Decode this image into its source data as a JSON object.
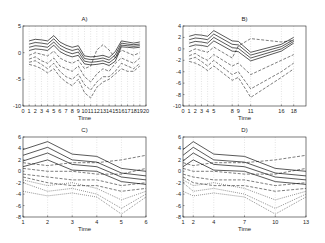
{
  "chart_data": [
    {
      "type": "line",
      "title": "A)",
      "xlabel": "Time",
      "ylabel": "",
      "x": [
        1,
        2,
        3,
        4,
        5,
        6,
        7,
        8,
        9,
        10,
        11,
        12,
        13,
        14,
        15,
        16,
        17,
        18,
        19,
        20
      ],
      "xticks": [
        "0",
        "1",
        "2",
        "3",
        "4",
        "5",
        "6",
        "7",
        "8",
        "9",
        "10",
        "11",
        "12",
        "13",
        "14",
        "15",
        "16",
        "17",
        "18",
        "19",
        "20"
      ],
      "xlim": [
        0,
        20
      ],
      "ylim": [
        -10,
        5
      ],
      "yticks": [
        "5",
        "0",
        "-5",
        "-10"
      ],
      "grid": "vertical dotted",
      "series": [
        {
          "name": "solid-1",
          "style": "solid",
          "values": [
            2.2,
            2.5,
            2.4,
            2.2,
            3.2,
            2.0,
            1.4,
            1.0,
            1.3,
            -0.6,
            -0.8,
            -0.7,
            -0.5,
            -0.9,
            0.2,
            2.2,
            2.0,
            1.8,
            2.0
          ]
        },
        {
          "name": "solid-2",
          "style": "solid",
          "values": [
            1.6,
            1.9,
            1.8,
            1.6,
            2.6,
            1.4,
            0.8,
            0.4,
            0.7,
            -1.1,
            -1.3,
            -1.2,
            -1.0,
            -1.4,
            -0.4,
            1.8,
            1.6,
            1.5,
            1.6
          ]
        },
        {
          "name": "solid-3",
          "style": "solid",
          "values": [
            1.0,
            1.3,
            1.2,
            1.0,
            2.0,
            0.8,
            0.2,
            -0.2,
            0.1,
            -1.6,
            -1.8,
            -1.7,
            -1.5,
            -1.9,
            -1.0,
            1.4,
            1.3,
            1.2,
            1.3
          ]
        },
        {
          "name": "solid-4",
          "style": "solid",
          "values": [
            0.4,
            0.7,
            0.6,
            0.4,
            1.4,
            0.2,
            -0.4,
            -0.8,
            -0.5,
            -2.1,
            -2.3,
            -2.2,
            -2.0,
            -2.4,
            -1.6,
            1.1,
            1.0,
            0.9,
            1.0
          ]
        },
        {
          "name": "dash-1",
          "style": "dashed",
          "values": [
            -0.5,
            0,
            -0.3,
            -0.6,
            0.3,
            -1.0,
            -1.6,
            -2.0,
            -1.4,
            -3.0,
            -2.5,
            0.5,
            1.5,
            0.5,
            -1.0,
            0.5,
            0,
            -0.5,
            0
          ]
        },
        {
          "name": "dash-2",
          "style": "dashed",
          "values": [
            -1.2,
            -0.8,
            -1.5,
            -2.0,
            -1.0,
            -2.5,
            -3.0,
            -3.5,
            -2.5,
            -4.5,
            -5.5,
            -4.0,
            -3.0,
            -3.5,
            -2.0,
            -1.0,
            -1.5,
            -2.0,
            -1.0
          ]
        },
        {
          "name": "dash-3",
          "style": "dashed",
          "values": [
            -1.8,
            -1.5,
            -2.2,
            -3.0,
            -2.0,
            -3.5,
            -4.5,
            -5.0,
            -4.0,
            -6.0,
            -7.0,
            -5.5,
            -4.5,
            -4.5,
            -3.5,
            -2.0,
            -2.5,
            -3.0,
            -2.0
          ]
        },
        {
          "name": "dash-4",
          "style": "dashed",
          "values": [
            -2.2,
            -2.5,
            -3.0,
            -3.8,
            -3.0,
            -4.5,
            -5.5,
            -6.2,
            -5.0,
            -7.5,
            -8.5,
            -6.5,
            -5.5,
            -5.0,
            -4.0,
            -3.0,
            -3.5,
            -3.5,
            -2.5
          ]
        }
      ]
    },
    {
      "type": "line",
      "title": "B)",
      "xlabel": "Time",
      "ylabel": "",
      "x": [
        1,
        2,
        3,
        4,
        5,
        8,
        9,
        11,
        16,
        18
      ],
      "xticks": [
        "0",
        "1",
        "2",
        "3",
        "4",
        "5",
        "8",
        "9",
        "11",
        "16",
        "18"
      ],
      "xlim": [
        0,
        20
      ],
      "ylim": [
        -10,
        4
      ],
      "yticks": [
        "4",
        "2",
        "0",
        "-2",
        "-4",
        "-6",
        "-8",
        "-10"
      ],
      "grid": "vertical dotted",
      "series": [
        {
          "name": "solid-1",
          "style": "solid",
          "values": [
            2.2,
            2.5,
            2.4,
            2.2,
            3.2,
            1.4,
            1.3,
            -0.6,
            0.8,
            2.0
          ]
        },
        {
          "name": "solid-2",
          "style": "solid",
          "values": [
            1.6,
            1.9,
            1.8,
            1.6,
            2.6,
            0.8,
            0.7,
            -1.1,
            0.4,
            1.6
          ]
        },
        {
          "name": "solid-3",
          "style": "solid",
          "values": [
            1.0,
            1.3,
            1.2,
            1.0,
            2.0,
            0.2,
            0.1,
            -1.6,
            0,
            1.3
          ]
        },
        {
          "name": "solid-4",
          "style": "solid",
          "values": [
            0.4,
            0.7,
            0.6,
            0.4,
            1.4,
            -0.4,
            -0.5,
            -2.1,
            -0.4,
            1.0
          ]
        },
        {
          "name": "dash-1",
          "style": "dashed",
          "values": [
            -0.5,
            0,
            -0.3,
            -0.6,
            0.3,
            -1.6,
            0.5,
            1.8,
            1.2,
            1.5
          ]
        },
        {
          "name": "dash-2",
          "style": "dashed",
          "values": [
            -1.2,
            -0.8,
            -1.5,
            -2.0,
            -1.0,
            -3.0,
            -2.5,
            -4.5,
            -2.0,
            -1.0
          ]
        },
        {
          "name": "dash-3",
          "style": "dashed",
          "values": [
            -1.8,
            -1.5,
            -2.2,
            -3.0,
            -2.0,
            -4.5,
            -4.0,
            -7.0,
            -4.0,
            -2.5
          ]
        },
        {
          "name": "dash-4",
          "style": "dashed",
          "values": [
            -2.2,
            -2.5,
            -3.0,
            -3.8,
            -3.0,
            -5.5,
            -5.0,
            -8.5,
            -5.0,
            -3.5
          ]
        }
      ]
    },
    {
      "type": "line",
      "title": "C)",
      "xlabel": "Time",
      "ylabel": "",
      "x": [
        1,
        2,
        3,
        4,
        5,
        6
      ],
      "xticks": [
        "1",
        "2",
        "3",
        "4",
        "5",
        "6"
      ],
      "xlim": [
        1,
        6
      ],
      "ylim": [
        -8,
        6
      ],
      "yticks": [
        "6",
        "4",
        "2",
        "0",
        "-2",
        "-4",
        "-6",
        "-8"
      ],
      "grid": "vertical dotted",
      "series": [
        {
          "name": "solid-1",
          "style": "solid",
          "values": [
            3.8,
            5.2,
            3.0,
            2.6,
            0.5,
            0
          ]
        },
        {
          "name": "solid-2",
          "style": "solid",
          "values": [
            2.8,
            4.2,
            2.0,
            1.6,
            -0.3,
            -0.8
          ]
        },
        {
          "name": "solid-3",
          "style": "solid",
          "values": [
            1.8,
            3.2,
            1.2,
            0.8,
            -1.0,
            -1.5
          ]
        },
        {
          "name": "solid-4",
          "style": "solid",
          "values": [
            0.8,
            2.0,
            0.2,
            0,
            -1.8,
            -2.3
          ]
        },
        {
          "name": "dash-1",
          "style": "dashed",
          "values": [
            1.5,
            1.0,
            1.5,
            1.5,
            2.0,
            2.8
          ]
        },
        {
          "name": "dash-2",
          "style": "dashed",
          "values": [
            0.5,
            0,
            0,
            -0.5,
            -0.5,
            0.5
          ]
        },
        {
          "name": "dash-3",
          "style": "dashed",
          "values": [
            -0.5,
            -1.0,
            -1.5,
            -1.5,
            -2.5,
            -2.0
          ]
        },
        {
          "name": "dash-4",
          "style": "dashed",
          "values": [
            -1.0,
            -2.0,
            -2.5,
            -2.5,
            -3.5,
            -3.0
          ]
        },
        {
          "name": "dot-1",
          "style": "dotted",
          "values": [
            -1.5,
            -2.5,
            -2.0,
            -3.0,
            -5.0,
            -3.5
          ]
        },
        {
          "name": "dot-2",
          "style": "dotted",
          "values": [
            -2.0,
            -3.5,
            -3.0,
            -4.0,
            -6.5,
            -4.0
          ]
        },
        {
          "name": "dot-3",
          "style": "dotted",
          "values": [
            -3.5,
            -4.3,
            -3.8,
            -4.5,
            -7.5,
            -4.5
          ]
        }
      ]
    },
    {
      "type": "line",
      "title": "D)",
      "xlabel": "Time",
      "ylabel": "",
      "x": [
        1,
        2,
        4,
        7,
        10,
        13
      ],
      "xticks": [
        "1",
        "2",
        "4",
        "7",
        "10",
        "13"
      ],
      "xlim": [
        1,
        13
      ],
      "ylim": [
        -8,
        6
      ],
      "yticks": [
        "6",
        "4",
        "2",
        "0",
        "-2",
        "-4",
        "-6",
        "-8"
      ],
      "grid": "vertical dotted",
      "series": [
        {
          "name": "solid-1",
          "style": "solid",
          "values": [
            3.8,
            5.2,
            3.0,
            2.6,
            0.5,
            0
          ]
        },
        {
          "name": "solid-2",
          "style": "solid",
          "values": [
            2.8,
            4.2,
            2.0,
            1.6,
            -0.3,
            -0.8
          ]
        },
        {
          "name": "solid-3",
          "style": "solid",
          "values": [
            1.8,
            3.2,
            1.2,
            0.8,
            -1.0,
            -1.5
          ]
        },
        {
          "name": "solid-4",
          "style": "solid",
          "values": [
            0.8,
            2.0,
            0.2,
            0,
            -1.8,
            -2.3
          ]
        },
        {
          "name": "dash-1",
          "style": "dashed",
          "values": [
            1.5,
            1.0,
            1.5,
            1.5,
            2.0,
            2.8
          ]
        },
        {
          "name": "dash-2",
          "style": "dashed",
          "values": [
            0.5,
            0,
            0,
            -0.5,
            -0.5,
            0.5
          ]
        },
        {
          "name": "dash-3",
          "style": "dashed",
          "values": [
            -0.5,
            -1.0,
            -1.5,
            -1.5,
            -2.5,
            -2.0
          ]
        },
        {
          "name": "dash-4",
          "style": "dashed",
          "values": [
            -1.0,
            -2.0,
            -2.5,
            -2.5,
            -3.5,
            -3.0
          ]
        },
        {
          "name": "dot-1",
          "style": "dotted",
          "values": [
            -1.5,
            -2.5,
            -2.0,
            -3.0,
            -5.0,
            -3.5
          ]
        },
        {
          "name": "dot-2",
          "style": "dotted",
          "values": [
            -2.0,
            -3.5,
            -3.0,
            -4.0,
            -6.5,
            -4.0
          ]
        },
        {
          "name": "dot-3",
          "style": "dotted",
          "values": [
            -3.5,
            -4.3,
            -3.8,
            -4.5,
            -7.5,
            -4.5
          ]
        }
      ]
    }
  ],
  "panels": {
    "a": {
      "title": "A)",
      "xlabel": "Time"
    },
    "b": {
      "title": "B)",
      "xlabel": "Time"
    },
    "c": {
      "title": "C)",
      "xlabel": "Time"
    },
    "d": {
      "title": "D)",
      "xlabel": "Time"
    }
  }
}
